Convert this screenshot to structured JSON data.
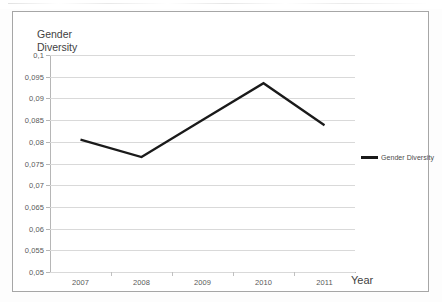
{
  "chart_data": {
    "type": "line",
    "title": "Gender\nDiversity",
    "xlabel": "Year",
    "ylabel": "",
    "categories": [
      "2007",
      "2008",
      "2009",
      "2010",
      "2011"
    ],
    "series": [
      {
        "name": "Gender Diversity",
        "values": [
          0.0805,
          0.0765,
          0.085,
          0.0935,
          0.0838
        ],
        "color": "#1a1a1a"
      }
    ],
    "ylim": [
      0.05,
      0.1
    ],
    "ytick_step": 0.005,
    "ytick_labels": [
      "0,1",
      "0,095",
      "0,09",
      "0,085",
      "0,08",
      "0,075",
      "0,07",
      "0,065",
      "0,06",
      "0,055",
      "0,05"
    ],
    "ytick_values": [
      0.1,
      0.095,
      0.09,
      0.085,
      0.08,
      0.075,
      0.07,
      0.065,
      0.06,
      0.055,
      0.05
    ],
    "grid": "horizontal",
    "legend_position": "right",
    "decimal_separator": ","
  },
  "legend": {
    "entries": [
      {
        "label": "Gender Diversity",
        "color": "#1a1a1a"
      }
    ]
  },
  "frame": {
    "border_color": "#a6a6a6",
    "gridline_color": "#d9d9d9",
    "axis_color": "#b6b6b6",
    "text_color": "#3f3f3f",
    "background": "#ffffff"
  }
}
